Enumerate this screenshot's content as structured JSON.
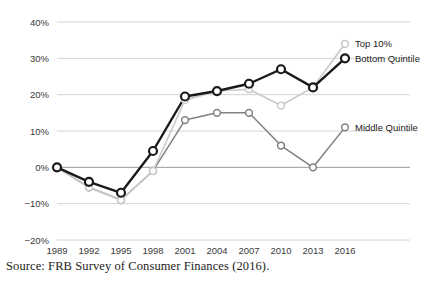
{
  "source_note": "Source: FRB Survey of Consumer Finances (2016).",
  "legend": {
    "top10": "Top 10%",
    "bottom": "Bottom Quintile",
    "middle": "Middle Quintile"
  },
  "colors": {
    "top10": "#c9c9c9",
    "bottom": "#1a1a1a",
    "middle": "#808080",
    "grid": "#cfcfcf",
    "zero_line": "#9a9a9a",
    "text": "#3a3a3a"
  },
  "chart_data": {
    "type": "line",
    "title": "",
    "xlabel": "",
    "ylabel": "",
    "grid": true,
    "legend_position": "right-inline",
    "categories": [
      "1989",
      "1992",
      "1995",
      "1998",
      "2001",
      "2004",
      "2007",
      "2010",
      "2013",
      "2016"
    ],
    "x": [
      1989,
      1992,
      1995,
      1998,
      2001,
      2004,
      2007,
      2010,
      2013,
      2016
    ],
    "ylim": [
      -20,
      40
    ],
    "yticks": [
      -20,
      -10,
      0,
      10,
      20,
      30,
      40
    ],
    "ytick_labels": [
      "−20%",
      "−10%",
      "0%",
      "10%",
      "20%",
      "30%",
      "40%"
    ],
    "series": [
      {
        "name": "Top 10%",
        "values": [
          0,
          -5.5,
          -9,
          -1,
          18.5,
          21,
          21.5,
          17,
          22,
          34
        ]
      },
      {
        "name": "Bottom Quintile",
        "values": [
          0,
          -4,
          -7,
          4.5,
          19.5,
          21,
          23,
          27,
          22,
          30
        ]
      },
      {
        "name": "Middle Quintile",
        "values": [
          0,
          -5.5,
          -9,
          -1,
          13,
          15,
          15,
          6,
          0,
          11
        ]
      }
    ]
  }
}
